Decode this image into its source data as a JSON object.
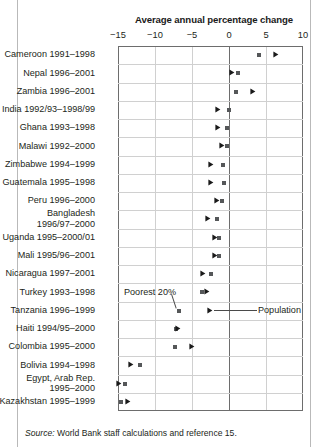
{
  "chart_data": {
    "type": "scatter",
    "title": "Average annual percentage change",
    "xlabel": "Average annual percentage change",
    "ylabel": "",
    "xlim": [
      -15,
      10
    ],
    "xticks": [
      -15,
      -10,
      -5,
      0,
      5,
      10
    ],
    "xtick_labels": [
      "−15",
      "−10",
      "−5",
      "0",
      "5",
      "10"
    ],
    "grid": true,
    "legend_position": "inline-annotation",
    "series": [
      {
        "name": "Poorest 20%",
        "marker": "square"
      },
      {
        "name": "Population",
        "marker": "arrow"
      }
    ],
    "categories": [
      "Cameroon 1991–1998",
      "Nepal 1996–2001",
      "Zambia 1996–2001",
      "India 1992/93–1998/99",
      "Ghana 1993–1998",
      "Malawi 1992–2000",
      "Zimbabwe 1994–1999",
      "Guatemala 1995–1998",
      "Peru 1996–2000",
      "Bangladesh\n1996/97–2000",
      "Uganda 1995–2000/01",
      "Mali 1995/96–2001",
      "Nicaragua 1997–2001",
      "Turkey 1993–1998",
      "Tanzania 1996–1999",
      "Haiti 1994/95–2000",
      "Colombia 1995–2000",
      "Bolivia 1994–1998",
      "Egypt, Arab Rep.\n1995–2000",
      "Kazakhstan 1995–1999"
    ],
    "rows": [
      {
        "label": "Cameroon 1991–1998",
        "poorest20": 4.0,
        "population": 6.3
      },
      {
        "label": "Nepal 1996–2001",
        "poorest20": 1.2,
        "population": 0.4
      },
      {
        "label": "Zambia 1996–2001",
        "poorest20": 1.0,
        "population": 3.2
      },
      {
        "label": "India 1992/93–1998/99",
        "poorest20": 0.0,
        "population": -1.5
      },
      {
        "label": "Ghana 1993–1998",
        "poorest20": -0.3,
        "population": -1.5
      },
      {
        "label": "Malawi 1992–2000",
        "poorest20": -0.3,
        "population": -0.9
      },
      {
        "label": "Zimbabwe 1994–1999",
        "poorest20": -0.8,
        "population": -2.5
      },
      {
        "label": "Guatemala 1995–1998",
        "poorest20": -0.7,
        "population": -2.4
      },
      {
        "label": "Peru 1996–2000",
        "poorest20": -1.0,
        "population": -1.6
      },
      {
        "label": "Bangladesh\n1996/97–2000",
        "poorest20": -1.6,
        "population": -2.8
      },
      {
        "label": "Uganda 1995–2000/01",
        "poorest20": -1.4,
        "population": -1.9
      },
      {
        "label": "Mali 1995/96–2001",
        "poorest20": -1.4,
        "population": -1.9
      },
      {
        "label": "Nicaragua 1997–2001",
        "poorest20": -2.4,
        "population": -3.5
      },
      {
        "label": "Turkey 1993–1998",
        "poorest20": -3.6,
        "population": -3.0
      },
      {
        "label": "Tanzania 1996–1999",
        "poorest20": -6.8,
        "population": -2.6
      },
      {
        "label": "Haiti 1994/95–2000",
        "poorest20": -7.2,
        "population": -6.9
      },
      {
        "label": "Colombia 1995–2000",
        "poorest20": -7.3,
        "population": -5.0
      },
      {
        "label": "Bolivia 1994–1998",
        "poorest20": -12.0,
        "population": -13.3
      },
      {
        "label": "Egypt, Arab Rep.\n1995–2000",
        "poorest20": -14.0,
        "population": -14.8
      },
      {
        "label": "Kazakhstan 1995–1999",
        "poorest20": -14.6,
        "population": -13.7
      }
    ],
    "annotations": [
      {
        "text": "Poorest 20%",
        "target_row": 14,
        "target_value": -6.8
      },
      {
        "text": "Population",
        "target_row": 14,
        "target_value": -2.6
      }
    ]
  },
  "footer": {
    "source_label": "Source:",
    "source_text": " World Bank staff calculations and reference 15."
  }
}
